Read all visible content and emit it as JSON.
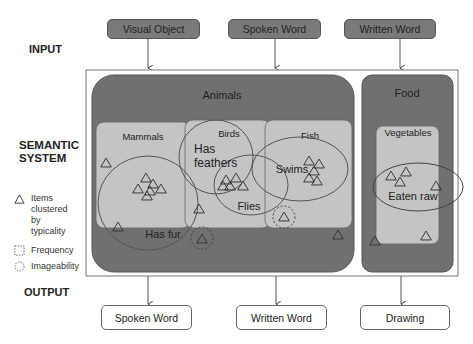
{
  "sections": {
    "input": "INPUT",
    "semantic_line1": "SEMANTIC",
    "semantic_line2": "SYSTEM",
    "output": "OUTPUT"
  },
  "inputs": [
    "Visual Object",
    "Spoken Word",
    "Written Word"
  ],
  "outputs": [
    "Spoken Word",
    "Written Word",
    "Drawing"
  ],
  "legend": {
    "items_line1": "Items",
    "items_line2": "clustered",
    "items_line3": "by",
    "items_line4": "typicality",
    "frequency": "Frequency",
    "imageability": "Imageability"
  },
  "categories": {
    "animals": "Animals",
    "food": "Food",
    "mammals": "Mammals",
    "birds": "Birds",
    "fish": "Fish",
    "vegetables": "Vegetables"
  },
  "features": {
    "has_fur": "Has fur",
    "has_feathers_1": "Has",
    "has_feathers_2": "feathers",
    "flies": "Flies",
    "swims": "Swims",
    "eaten_raw": "Eaten raw"
  },
  "colors": {
    "dark_region": "#707070",
    "light_region": "#c4c4c4",
    "input_box": "#7a7a7a",
    "line": "#444444"
  }
}
